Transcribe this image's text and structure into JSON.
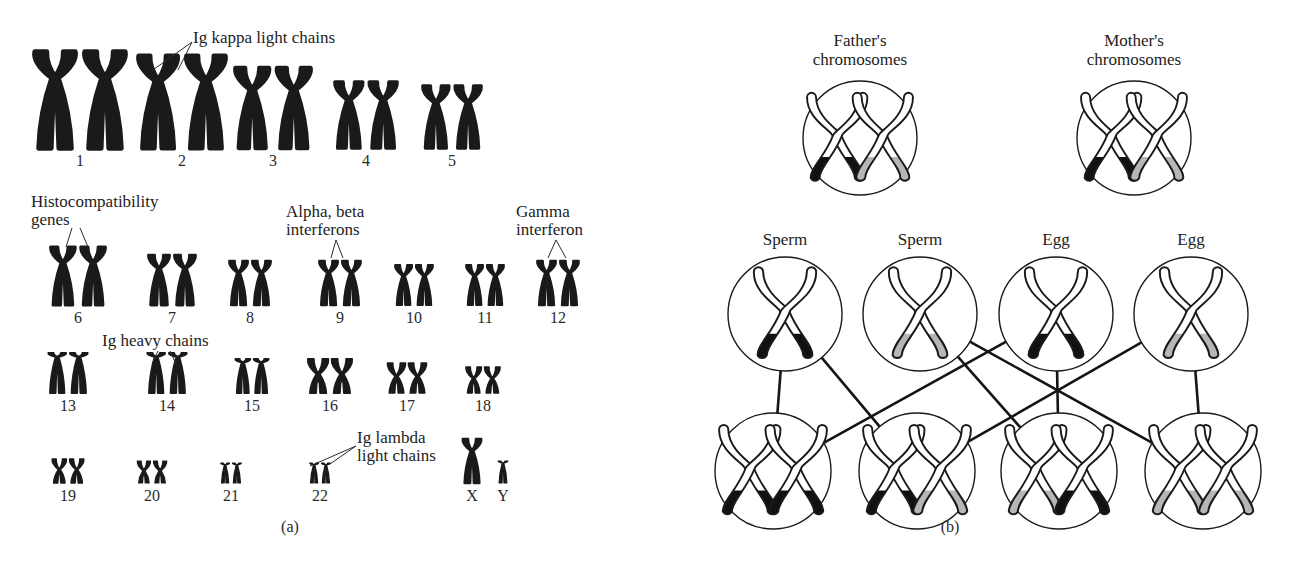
{
  "figure": {
    "panels": [
      {
        "id": "a",
        "caption": "(a)"
      },
      {
        "id": "b",
        "caption": "(b)"
      }
    ]
  },
  "panel_a": {
    "caption": "(a)",
    "title": "Human karyotype with immune gene loci",
    "annotations": [
      {
        "id": "ig-kappa",
        "text": "Ig kappa light chains",
        "target": "2"
      },
      {
        "id": "histocompatibility",
        "text": "Histocompatibility\ngenes",
        "text_line1": "Histocompatibility",
        "text_line2": "genes",
        "target": "6"
      },
      {
        "id": "alpha-beta-interferons",
        "text": "Alpha, beta\ninterferons",
        "text_line1": "Alpha, beta",
        "text_line2": "interferons",
        "target": "9"
      },
      {
        "id": "gamma-interferon",
        "text": "Gamma\ninterferon",
        "text_line1": "Gamma",
        "text_line2": "interferon",
        "target": "12"
      },
      {
        "id": "ig-heavy",
        "text": "Ig heavy chains",
        "target": "14"
      },
      {
        "id": "ig-lambda",
        "text": "Ig lambda\nlight chains",
        "text_line1": "Ig lambda",
        "text_line2": "light chains",
        "target": "22"
      }
    ],
    "rows": [
      {
        "row": 1,
        "chromosomes": [
          {
            "label": "1",
            "x": 80,
            "size": 96,
            "type": "submetacentric"
          },
          {
            "label": "2",
            "x": 182,
            "size": 92,
            "type": "submetacentric"
          },
          {
            "label": "3",
            "x": 273,
            "size": 80,
            "type": "submetacentric"
          },
          {
            "label": "4",
            "x": 366,
            "size": 66,
            "type": "submetacentric"
          },
          {
            "label": "5",
            "x": 452,
            "size": 62,
            "type": "submetacentric"
          }
        ]
      },
      {
        "row": 2,
        "chromosomes": [
          {
            "label": "6",
            "x": 78,
            "size": 58,
            "type": "submetacentric"
          },
          {
            "label": "7",
            "x": 172,
            "size": 50,
            "type": "submetacentric"
          },
          {
            "label": "8",
            "x": 250,
            "size": 44,
            "type": "submetacentric"
          },
          {
            "label": "9",
            "x": 340,
            "size": 44,
            "type": "submetacentric"
          },
          {
            "label": "10",
            "x": 414,
            "size": 40,
            "type": "submetacentric"
          },
          {
            "label": "11",
            "x": 485,
            "size": 40,
            "type": "submetacentric"
          },
          {
            "label": "12",
            "x": 558,
            "size": 44,
            "type": "submetacentric"
          }
        ]
      },
      {
        "row": 3,
        "chromosomes": [
          {
            "label": "13",
            "x": 68,
            "size": 40,
            "type": "acrocentric"
          },
          {
            "label": "14",
            "x": 167,
            "size": 40,
            "type": "acrocentric"
          },
          {
            "label": "15",
            "x": 252,
            "size": 34,
            "type": "acrocentric"
          },
          {
            "label": "16",
            "x": 330,
            "size": 34,
            "type": "metacentric"
          },
          {
            "label": "17",
            "x": 407,
            "size": 30,
            "type": "metacentric"
          },
          {
            "label": "18",
            "x": 483,
            "size": 26,
            "type": "metacentric"
          }
        ]
      },
      {
        "row": 4,
        "chromosomes": [
          {
            "label": "19",
            "x": 68,
            "size": 24,
            "type": "metacentric"
          },
          {
            "label": "20",
            "x": 152,
            "size": 22,
            "type": "metacentric"
          },
          {
            "label": "21",
            "x": 231,
            "size": 20,
            "type": "acrocentric"
          },
          {
            "label": "22",
            "x": 320,
            "size": 20,
            "type": "acrocentric"
          },
          {
            "label": "X",
            "x": 472,
            "size": 44,
            "type": "submetacentric",
            "single": true
          },
          {
            "label": "Y",
            "x": 503,
            "size": 22,
            "type": "acrocentric",
            "single": true
          }
        ]
      }
    ]
  },
  "panel_b": {
    "caption": "(b)",
    "title": "Inheritance of chromosome pairs from parents to offspring",
    "parents": [
      {
        "id": "father",
        "label_line1": "Father's",
        "label_line2": "chromosomes",
        "x": 860,
        "y": 138,
        "r": 57,
        "chromosomes": [
          "black",
          "gray"
        ]
      },
      {
        "id": "mother",
        "label_line1": "Mother's",
        "label_line2": "chromosomes",
        "x": 1134,
        "y": 138,
        "r": 57,
        "chromosomes": [
          "black",
          "gray"
        ]
      }
    ],
    "gametes": [
      {
        "id": "sperm-1",
        "label": "Sperm",
        "x": 785,
        "y": 314,
        "r": 57,
        "chromosome": "black"
      },
      {
        "id": "sperm-2",
        "label": "Sperm",
        "x": 920,
        "y": 314,
        "r": 57,
        "chromosome": "gray"
      },
      {
        "id": "egg-1",
        "label": "Egg",
        "x": 1056,
        "y": 314,
        "r": 57,
        "chromosome": "black"
      },
      {
        "id": "egg-2",
        "label": "Egg",
        "x": 1191,
        "y": 314,
        "r": 57,
        "chromosome": "gray"
      }
    ],
    "offspring": [
      {
        "id": "offspring-1",
        "x": 773,
        "y": 471,
        "r": 58,
        "chromosomes": [
          "black",
          "black"
        ]
      },
      {
        "id": "offspring-2",
        "x": 917,
        "y": 471,
        "r": 58,
        "chromosomes": [
          "black",
          "gray"
        ]
      },
      {
        "id": "offspring-3",
        "x": 1059,
        "y": 471,
        "r": 58,
        "chromosomes": [
          "gray",
          "black"
        ]
      },
      {
        "id": "offspring-4",
        "x": 1203,
        "y": 471,
        "r": 58,
        "chromosomes": [
          "gray",
          "gray"
        ]
      }
    ],
    "connections": [
      {
        "from": "sperm-1",
        "to": "offspring-1"
      },
      {
        "from": "sperm-1",
        "to": "offspring-2"
      },
      {
        "from": "sperm-2",
        "to": "offspring-3"
      },
      {
        "from": "sperm-2",
        "to": "offspring-4"
      },
      {
        "from": "egg-1",
        "to": "offspring-1"
      },
      {
        "from": "egg-1",
        "to": "offspring-3"
      },
      {
        "from": "egg-2",
        "to": "offspring-2"
      },
      {
        "from": "egg-2",
        "to": "offspring-4"
      }
    ]
  },
  "colors": {
    "ink": "#1a1a1a",
    "paternal_band": "#111111",
    "maternal_band": "#b6b6b6",
    "background": "#ffffff",
    "chromosome_outline": "#1a1a1a",
    "chromosome_fill": "#ffffff"
  }
}
